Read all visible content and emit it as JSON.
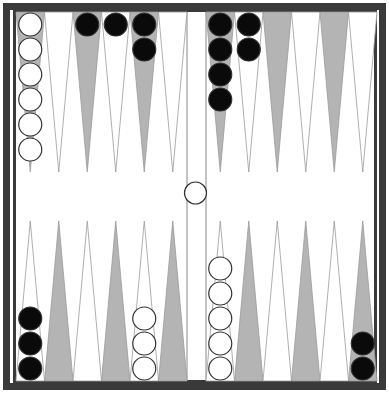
{
  "game": "backgammon",
  "colors": {
    "frame": "#3a3a3a",
    "dark_point": "#b4b4b4",
    "light_point": "#ffffff",
    "point_outline": "#9a9a9a",
    "black_checker": "#0a0a0a",
    "white_checker": "#ffffff",
    "checker_outline": "#333333"
  },
  "board": {
    "play_left": 16,
    "play_right": 377,
    "play_top": 12,
    "play_bottom": 381,
    "bar_left": 187,
    "bar_right": 206,
    "point_height": 160
  },
  "top_left_points": [
    {
      "shade": "dark",
      "checkers": {
        "color": "white",
        "count": 6
      }
    },
    {
      "shade": "light",
      "checkers": {
        "color": "none",
        "count": 0
      }
    },
    {
      "shade": "dark",
      "checkers": {
        "color": "black",
        "count": 1
      }
    },
    {
      "shade": "light",
      "checkers": {
        "color": "black",
        "count": 1
      }
    },
    {
      "shade": "dark",
      "checkers": {
        "color": "black",
        "count": 2
      }
    },
    {
      "shade": "light",
      "checkers": {
        "color": "none",
        "count": 0
      }
    }
  ],
  "top_right_points": [
    {
      "shade": "dark",
      "checkers": {
        "color": "black",
        "count": 4
      }
    },
    {
      "shade": "light",
      "checkers": {
        "color": "black",
        "count": 2
      }
    },
    {
      "shade": "dark",
      "checkers": {
        "color": "none",
        "count": 0
      }
    },
    {
      "shade": "light",
      "checkers": {
        "color": "none",
        "count": 0
      }
    },
    {
      "shade": "dark",
      "checkers": {
        "color": "none",
        "count": 0
      }
    },
    {
      "shade": "light",
      "checkers": {
        "color": "none",
        "count": 0
      }
    }
  ],
  "bottom_left_points": [
    {
      "shade": "light",
      "checkers": {
        "color": "black",
        "count": 3
      }
    },
    {
      "shade": "dark",
      "checkers": {
        "color": "none",
        "count": 0
      }
    },
    {
      "shade": "light",
      "checkers": {
        "color": "none",
        "count": 0
      }
    },
    {
      "shade": "dark",
      "checkers": {
        "color": "none",
        "count": 0
      }
    },
    {
      "shade": "light",
      "checkers": {
        "color": "white",
        "count": 3
      }
    },
    {
      "shade": "dark",
      "checkers": {
        "color": "none",
        "count": 0
      }
    }
  ],
  "bottom_right_points": [
    {
      "shade": "light",
      "checkers": {
        "color": "white",
        "count": 5
      }
    },
    {
      "shade": "dark",
      "checkers": {
        "color": "none",
        "count": 0
      }
    },
    {
      "shade": "light",
      "checkers": {
        "color": "none",
        "count": 0
      }
    },
    {
      "shade": "dark",
      "checkers": {
        "color": "none",
        "count": 0
      }
    },
    {
      "shade": "light",
      "checkers": {
        "color": "none",
        "count": 0
      }
    },
    {
      "shade": "dark",
      "checkers": {
        "color": "black",
        "count": 2
      }
    }
  ],
  "bar": {
    "checkers": [
      {
        "color": "white",
        "count": 1
      }
    ]
  }
}
